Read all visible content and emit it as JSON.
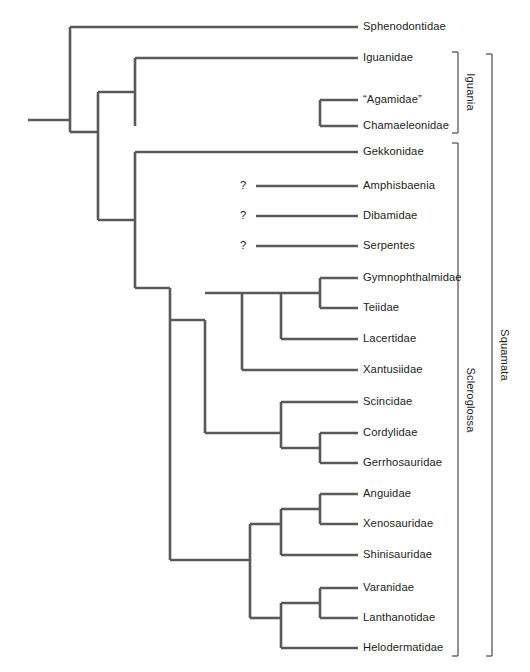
{
  "figure": {
    "type": "cladogram",
    "line_color": "#595959",
    "text_color": "#1d1d1d",
    "background_color": "#ffffff",
    "uncertain_marker": "?"
  },
  "tips": [
    {
      "label": "Sphenodontidae",
      "y": 27,
      "branch_start_x": 70,
      "uncertain": false
    },
    {
      "label": "Iguanidae",
      "y": 58,
      "branch_start_x": 135,
      "uncertain": false
    },
    {
      "label": "“Agamidae”",
      "y": 100,
      "branch_start_x": 320,
      "uncertain": false
    },
    {
      "label": "Chamaeleonidae",
      "y": 126,
      "branch_start_x": 320,
      "uncertain": false
    },
    {
      "label": "Gekkonidae",
      "y": 152,
      "branch_start_x": 135,
      "uncertain": false
    },
    {
      "label": "Amphisbaenia",
      "y": 186,
      "branch_start_x": 256,
      "uncertain": true
    },
    {
      "label": "Dibamidae",
      "y": 216,
      "branch_start_x": 256,
      "uncertain": true
    },
    {
      "label": "Serpentes",
      "y": 246,
      "branch_start_x": 256,
      "uncertain": true
    },
    {
      "label": "Gymnophthalmidae",
      "y": 278,
      "branch_start_x": 320,
      "uncertain": false
    },
    {
      "label": "Teiidae",
      "y": 308,
      "branch_start_x": 320,
      "uncertain": false
    },
    {
      "label": "Lacertidae",
      "y": 339,
      "branch_start_x": 281,
      "uncertain": false
    },
    {
      "label": "Xantusiidae",
      "y": 370,
      "branch_start_x": 242,
      "uncertain": false
    },
    {
      "label": "Scincidae",
      "y": 402,
      "branch_start_x": 281,
      "uncertain": false
    },
    {
      "label": "Cordylidae",
      "y": 433,
      "branch_start_x": 320,
      "uncertain": false
    },
    {
      "label": "Gerrhosauridae",
      "y": 463,
      "branch_start_x": 320,
      "uncertain": false
    },
    {
      "label": "Anguidae",
      "y": 494,
      "branch_start_x": 320,
      "uncertain": false
    },
    {
      "label": "Xenosauridae",
      "y": 524,
      "branch_start_x": 320,
      "uncertain": false
    },
    {
      "label": "Shinisauridae",
      "y": 555,
      "branch_start_x": 281,
      "uncertain": false
    },
    {
      "label": "Varanidae",
      "y": 588,
      "branch_start_x": 320,
      "uncertain": false
    },
    {
      "label": "Lanthanotidae",
      "y": 618,
      "branch_start_x": 320,
      "uncertain": false
    },
    {
      "label": "Helodermatidae",
      "y": 648,
      "branch_start_x": 281,
      "uncertain": false
    }
  ],
  "geometry": {
    "tip_end_x": 358,
    "label_x": 363,
    "root_stem_x": 28,
    "root_x": 70,
    "qmark_x": 243
  },
  "nodes": [
    {
      "name": "root",
      "x": 70,
      "y_top": 27,
      "y_bottom": 132
    },
    {
      "name": "squamata",
      "x": 98,
      "y_top": 92,
      "y_bottom": 220
    },
    {
      "name": "iguania",
      "x": 135,
      "y_top": 58,
      "y_bottom": 126
    },
    {
      "name": "agamidae-chamaeleonidae",
      "x": 320,
      "y_top": 100,
      "y_bottom": 126
    },
    {
      "name": "scleroglossa",
      "x": 135,
      "y_top": 152,
      "y_bottom": 288
    },
    {
      "name": "autarchoglossa",
      "x": 170,
      "y_top": 288,
      "y_bottom": 560
    },
    {
      "name": "scincomorpha",
      "x": 205,
      "y_top": 320,
      "y_bottom": 433
    },
    {
      "name": "lacertiformes",
      "x": 242,
      "y_top": 293,
      "y_bottom": 370
    },
    {
      "name": "lacertoidea",
      "x": 281,
      "y_top": 293,
      "y_bottom": 339
    },
    {
      "name": "gymnophthalmidae-teiidae",
      "x": 320,
      "y_top": 278,
      "y_bottom": 308
    },
    {
      "name": "scincoidea",
      "x": 281,
      "y_top": 402,
      "y_bottom": 448
    },
    {
      "name": "cordylidae-gerrhosauridae",
      "x": 320,
      "y_top": 433,
      "y_bottom": 463
    },
    {
      "name": "anguimorpha",
      "x": 250,
      "y_top": 524,
      "y_bottom": 618
    },
    {
      "name": "anguioidea",
      "x": 281,
      "y_top": 509,
      "y_bottom": 555
    },
    {
      "name": "anguidae-xenosauridae",
      "x": 320,
      "y_top": 494,
      "y_bottom": 524
    },
    {
      "name": "varanoidea",
      "x": 281,
      "y_top": 603,
      "y_bottom": 648
    },
    {
      "name": "varanidae-lanthanotidae",
      "x": 320,
      "y_top": 588,
      "y_bottom": 618
    }
  ],
  "clade_brackets": [
    {
      "label": "Iguania",
      "x": 458,
      "tick_x": 452,
      "y_top": 52,
      "y_bottom": 133,
      "label_x": 470,
      "label_y": 92
    },
    {
      "label": "Scleroglossa",
      "x": 458,
      "tick_x": 452,
      "y_top": 143,
      "y_bottom": 656,
      "label_x": 470,
      "label_y": 400
    },
    {
      "label": "Squamata",
      "x": 492,
      "tick_x": 486,
      "y_top": 54,
      "y_bottom": 656,
      "label_x": 504,
      "label_y": 355
    }
  ]
}
